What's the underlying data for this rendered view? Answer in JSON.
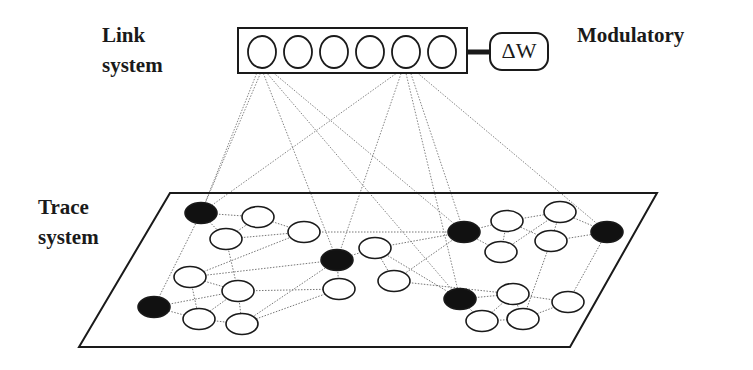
{
  "labels": {
    "link_line1": "Link",
    "link_line2": "system",
    "modulatory": "Modulatory",
    "trace_line1": "Trace",
    "trace_line2": "system",
    "delta_w": "ΔW"
  },
  "colors": {
    "stroke": "#1a1a1a",
    "edge": "#777777",
    "filled": "#111111",
    "bg": "#ffffff"
  },
  "link_system": {
    "box": {
      "x": 238,
      "y": 28,
      "w": 229,
      "h": 45
    },
    "units": [
      {
        "id": "L1",
        "cx": 262,
        "cy": 52,
        "r": 15
      },
      {
        "id": "L2",
        "cx": 298,
        "cy": 52,
        "r": 15
      },
      {
        "id": "L3",
        "cx": 334,
        "cy": 52,
        "r": 15
      },
      {
        "id": "L4",
        "cx": 370,
        "cy": 52,
        "r": 15
      },
      {
        "id": "L5",
        "cx": 406,
        "cy": 52,
        "r": 15
      },
      {
        "id": "L6",
        "cx": 442,
        "cy": 52,
        "r": 15
      }
    ]
  },
  "modulatory": {
    "box": {
      "x": 490,
      "y": 33,
      "w": 58,
      "h": 37,
      "rx": 12
    },
    "connector": {
      "x1": 467,
      "x2": 490,
      "y": 52
    }
  },
  "trace_plane": {
    "points": "170,193 657,193 570,347 79,347"
  },
  "trace_nodes": [
    {
      "id": "A",
      "cx": 201,
      "cy": 213,
      "filled": true
    },
    {
      "id": "W1",
      "cx": 258,
      "cy": 217,
      "filled": false
    },
    {
      "id": "W2",
      "cx": 226,
      "cy": 239,
      "filled": false
    },
    {
      "id": "W3",
      "cx": 304,
      "cy": 232,
      "filled": false
    },
    {
      "id": "W4",
      "cx": 190,
      "cy": 277,
      "filled": false
    },
    {
      "id": "W5",
      "cx": 238,
      "cy": 291,
      "filled": false
    },
    {
      "id": "B",
      "cx": 154,
      "cy": 307,
      "filled": true
    },
    {
      "id": "W6",
      "cx": 199,
      "cy": 319,
      "filled": false
    },
    {
      "id": "W7",
      "cx": 242,
      "cy": 324,
      "filled": false
    },
    {
      "id": "C",
      "cx": 337,
      "cy": 260,
      "filled": true
    },
    {
      "id": "W8",
      "cx": 375,
      "cy": 248,
      "filled": false
    },
    {
      "id": "W9",
      "cx": 394,
      "cy": 281,
      "filled": false
    },
    {
      "id": "W10",
      "cx": 339,
      "cy": 289,
      "filled": false
    },
    {
      "id": "D",
      "cx": 464,
      "cy": 232,
      "filled": true
    },
    {
      "id": "W12",
      "cx": 507,
      "cy": 221,
      "filled": false
    },
    {
      "id": "W13",
      "cx": 560,
      "cy": 212,
      "filled": false
    },
    {
      "id": "W14",
      "cx": 551,
      "cy": 241,
      "filled": false
    },
    {
      "id": "W15",
      "cx": 501,
      "cy": 252,
      "filled": false
    },
    {
      "id": "F",
      "cx": 607,
      "cy": 232,
      "filled": true
    },
    {
      "id": "E",
      "cx": 460,
      "cy": 299,
      "filled": true
    },
    {
      "id": "W16",
      "cx": 513,
      "cy": 294,
      "filled": false
    },
    {
      "id": "W17",
      "cx": 568,
      "cy": 302,
      "filled": false
    },
    {
      "id": "W18",
      "cx": 482,
      "cy": 321,
      "filled": false
    },
    {
      "id": "W19",
      "cx": 523,
      "cy": 319,
      "filled": false
    }
  ],
  "trace_edges": [
    [
      "A",
      "W1"
    ],
    [
      "A",
      "W2"
    ],
    [
      "W1",
      "W2"
    ],
    [
      "W1",
      "W3"
    ],
    [
      "W2",
      "W3"
    ],
    [
      "A",
      "B"
    ],
    [
      "W2",
      "W5"
    ],
    [
      "W4",
      "W3"
    ],
    [
      "W4",
      "W5"
    ],
    [
      "W4",
      "W6"
    ],
    [
      "B",
      "W5"
    ],
    [
      "B",
      "W6"
    ],
    [
      "W5",
      "W6"
    ],
    [
      "W5",
      "W7"
    ],
    [
      "W6",
      "W7"
    ],
    [
      "W5",
      "W10"
    ],
    [
      "W7",
      "C"
    ],
    [
      "W7",
      "W10"
    ],
    [
      "C",
      "W10"
    ],
    [
      "C",
      "W8"
    ],
    [
      "C",
      "W4"
    ],
    [
      "W3",
      "D"
    ],
    [
      "W8",
      "D"
    ],
    [
      "W8",
      "W9"
    ],
    [
      "W9",
      "D"
    ],
    [
      "W8",
      "E"
    ],
    [
      "W9",
      "W16"
    ],
    [
      "D",
      "W12"
    ],
    [
      "D",
      "W15"
    ],
    [
      "W12",
      "W13"
    ],
    [
      "W12",
      "W15"
    ],
    [
      "W13",
      "W14"
    ],
    [
      "W12",
      "W14"
    ],
    [
      "W15",
      "W13"
    ],
    [
      "W14",
      "F"
    ],
    [
      "W13",
      "F"
    ],
    [
      "F",
      "W17"
    ],
    [
      "W14",
      "W19"
    ],
    [
      "E",
      "W16"
    ],
    [
      "E",
      "W18"
    ],
    [
      "W16",
      "W18"
    ],
    [
      "W16",
      "W19"
    ],
    [
      "W18",
      "W19"
    ],
    [
      "W19",
      "W17"
    ],
    [
      "W16",
      "W17"
    ]
  ],
  "link_edges": [
    [
      "L1",
      "A"
    ],
    [
      "L1",
      "A"
    ],
    [
      "L1",
      "C"
    ],
    [
      "L1",
      "D"
    ],
    [
      "L1",
      "E"
    ],
    [
      "L5",
      "A"
    ],
    [
      "L5",
      "C"
    ],
    [
      "L5",
      "D"
    ],
    [
      "L5",
      "E"
    ],
    [
      "L5",
      "F"
    ]
  ]
}
